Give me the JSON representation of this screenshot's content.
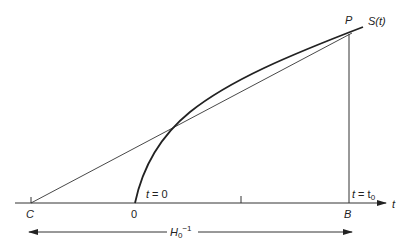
{
  "diagram": {
    "labels": {
      "P": "P",
      "S": "S(",
      "S_arg": "t",
      "S_close": ")",
      "C": "C",
      "origin": "0",
      "B": "B",
      "t_axis": "t",
      "t_zero_t": "t",
      "t_zero_rest": " = 0",
      "t_t0_t": "t",
      "t_t0_eq": " = t",
      "t_t0_sub": "0",
      "H": "H",
      "H_sub": "0",
      "H_sup": "−1"
    },
    "colors": {
      "ink": "#222222",
      "background": "#ffffff"
    }
  }
}
